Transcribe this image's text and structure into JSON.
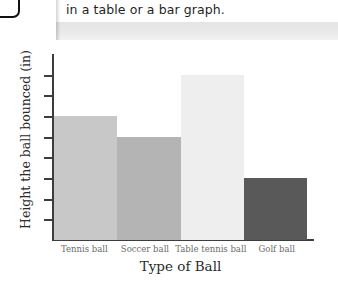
{
  "header": {
    "text": "in a table or a bar graph."
  },
  "chart_data": {
    "type": "bar",
    "title": "",
    "xlabel": "Type of Ball",
    "ylabel": "Height the ball bounced (in)",
    "categories": [
      "Tennis ball",
      "Soccer ball",
      "Table tennis ball",
      "Golf ball"
    ],
    "values": [
      6,
      5,
      8,
      3
    ],
    "ylim": [
      0,
      9
    ],
    "y_tick_count": 8,
    "grid": false,
    "legend": null,
    "bar_colors": [
      "#c8c8c8",
      "#b4b4b4",
      "#eeeeee",
      "#595959"
    ],
    "axis_color": "#3d3d3d"
  }
}
